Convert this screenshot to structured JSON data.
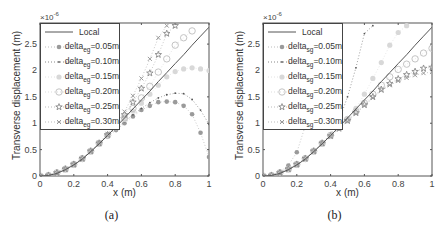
{
  "chart_data": [
    {
      "type": "line",
      "panel_label": "(a)",
      "title": "",
      "xlabel": "x (m)",
      "ylabel": "Transverse displacement (m)",
      "y_exponent": "×10^-6",
      "xlim": [
        0,
        1
      ],
      "ylim": [
        0,
        2.9
      ],
      "xticks": [
        "0",
        "0.2",
        "0.4",
        "0.6",
        "0.8",
        "1"
      ],
      "yticks": [
        "0",
        "0.5",
        "1",
        "1.5",
        "2",
        "2.5"
      ],
      "legend_position": "upper left",
      "subscript": "eg",
      "series": [
        {
          "name": "Local",
          "marker": "line",
          "x": [
            0,
            0.05,
            0.1,
            0.15,
            0.2,
            0.25,
            0.3,
            0.35,
            0.4,
            0.45,
            0.5,
            0.55,
            0.6,
            0.65,
            0.7,
            0.75,
            0.8,
            0.85,
            0.9,
            0.95,
            1.0
          ],
          "y": [
            0,
            0.01,
            0.05,
            0.12,
            0.21,
            0.32,
            0.46,
            0.61,
            0.77,
            0.93,
            1.1,
            1.27,
            1.44,
            1.61,
            1.79,
            1.96,
            2.13,
            2.3,
            2.48,
            2.65,
            2.82
          ]
        },
        {
          "name": "delta_eg=0.05m",
          "marker": "filled-circle",
          "x": [
            0,
            0.05,
            0.1,
            0.15,
            0.2,
            0.25,
            0.3,
            0.35,
            0.4,
            0.45,
            0.5,
            0.55,
            0.6,
            0.65,
            0.7,
            0.75,
            0.8,
            0.85,
            0.9,
            0.95,
            1.0
          ],
          "y": [
            0,
            0.01,
            0.06,
            0.13,
            0.22,
            0.33,
            0.47,
            0.62,
            0.75,
            0.87,
            1.0,
            1.13,
            1.25,
            1.33,
            1.4,
            1.41,
            1.4,
            1.33,
            1.17,
            0.82,
            0.36
          ]
        },
        {
          "name": "delta_eg=0.10m",
          "marker": "dot",
          "x": [
            0,
            0.05,
            0.1,
            0.15,
            0.2,
            0.25,
            0.3,
            0.35,
            0.4,
            0.45,
            0.5,
            0.55,
            0.6,
            0.65,
            0.7,
            0.75,
            0.8,
            0.85,
            0.9,
            0.95,
            1.0
          ],
          "y": [
            0,
            0.01,
            0.06,
            0.13,
            0.22,
            0.33,
            0.47,
            0.62,
            0.77,
            0.9,
            1.03,
            1.16,
            1.28,
            1.39,
            1.48,
            1.54,
            1.57,
            1.56,
            1.45,
            1.25,
            0.98
          ]
        },
        {
          "name": "delta_eg=0.15m",
          "marker": "filled-circle-light",
          "x": [
            0,
            0.05,
            0.1,
            0.15,
            0.2,
            0.25,
            0.3,
            0.35,
            0.4,
            0.45,
            0.5,
            0.55,
            0.6,
            0.65,
            0.7,
            0.75,
            0.8,
            0.85,
            0.9,
            0.95,
            1.0
          ],
          "y": [
            0,
            0.01,
            0.06,
            0.13,
            0.22,
            0.33,
            0.47,
            0.62,
            0.77,
            0.92,
            1.07,
            1.23,
            1.38,
            1.55,
            1.72,
            1.88,
            1.98,
            2.03,
            2.05,
            2.03,
            2.0
          ]
        },
        {
          "name": "delta_eg=0.20m",
          "marker": "open-circle",
          "x": [
            0,
            0.05,
            0.1,
            0.15,
            0.2,
            0.25,
            0.3,
            0.35,
            0.4,
            0.45,
            0.5,
            0.55,
            0.6,
            0.65,
            0.7,
            0.75,
            0.8,
            0.85,
            0.9
          ],
          "y": [
            0,
            0.01,
            0.06,
            0.13,
            0.22,
            0.33,
            0.47,
            0.62,
            0.77,
            0.93,
            1.1,
            1.28,
            1.48,
            1.7,
            1.97,
            2.22,
            2.48,
            2.62,
            2.75
          ]
        },
        {
          "name": "delta_eg=0.25m",
          "marker": "star",
          "x": [
            0,
            0.05,
            0.1,
            0.15,
            0.2,
            0.25,
            0.3,
            0.35,
            0.4,
            0.45,
            0.5,
            0.55,
            0.6,
            0.65,
            0.7,
            0.75,
            0.8
          ],
          "y": [
            0,
            0.01,
            0.06,
            0.13,
            0.22,
            0.33,
            0.47,
            0.62,
            0.78,
            0.96,
            1.16,
            1.4,
            1.66,
            1.95,
            2.3,
            2.7,
            2.85
          ]
        },
        {
          "name": "delta_eg=0.30m",
          "marker": "x",
          "x": [
            0,
            0.05,
            0.1,
            0.15,
            0.2,
            0.25,
            0.3,
            0.35,
            0.4,
            0.45,
            0.5,
            0.55,
            0.6,
            0.65,
            0.7,
            0.75
          ],
          "y": [
            0,
            0.01,
            0.06,
            0.13,
            0.22,
            0.33,
            0.47,
            0.63,
            0.8,
            0.99,
            1.22,
            1.52,
            1.85,
            2.22,
            2.62,
            2.85
          ]
        }
      ]
    },
    {
      "type": "line",
      "panel_label": "(b)",
      "title": "",
      "xlabel": "x (m)",
      "ylabel": "Transverse displacement (m)",
      "y_exponent": "×10^-6",
      "xlim": [
        0,
        1
      ],
      "ylim": [
        0,
        2.9
      ],
      "xticks": [
        "0",
        "0.2",
        "0.4",
        "0.6",
        "0.8",
        "1"
      ],
      "yticks": [
        "0",
        "0.5",
        "1",
        "1.5",
        "2",
        "2.5"
      ],
      "legend_position": "upper left",
      "subscript": "sg",
      "series": [
        {
          "name": "Local",
          "marker": "line",
          "x": [
            0,
            0.05,
            0.1,
            0.15,
            0.2,
            0.25,
            0.3,
            0.35,
            0.4,
            0.45,
            0.5,
            0.55,
            0.6,
            0.65,
            0.7,
            0.75,
            0.8,
            0.85,
            0.9,
            0.95,
            1.0
          ],
          "y": [
            0,
            0.01,
            0.05,
            0.12,
            0.21,
            0.32,
            0.46,
            0.61,
            0.77,
            0.93,
            1.1,
            1.27,
            1.44,
            1.61,
            1.79,
            1.96,
            2.13,
            2.3,
            2.48,
            2.65,
            2.82
          ]
        },
        {
          "name": "delta_sg=0.05m",
          "marker": "filled-circle",
          "x": [
            0,
            0.05,
            0.1,
            0.15,
            0.2,
            0.25,
            0.3
          ],
          "y": [
            0,
            0.02,
            0.08,
            0.2,
            0.45,
            0.95,
            1.6
          ]
        },
        {
          "name": "delta_sg=0.10m",
          "marker": "dot",
          "x": [
            0,
            0.05,
            0.1,
            0.15,
            0.2,
            0.25,
            0.3,
            0.35,
            0.4,
            0.45,
            0.5,
            0.55,
            0.6,
            0.65
          ],
          "y": [
            0,
            0.01,
            0.06,
            0.13,
            0.22,
            0.33,
            0.47,
            0.62,
            0.8,
            1.05,
            1.5,
            2.05,
            2.7,
            2.85
          ]
        },
        {
          "name": "delta_sg=0.15m",
          "marker": "filled-circle-light",
          "x": [
            0,
            0.05,
            0.1,
            0.15,
            0.2,
            0.25,
            0.3,
            0.35,
            0.4,
            0.45,
            0.5,
            0.55,
            0.6,
            0.65,
            0.7,
            0.75,
            0.8,
            0.85
          ],
          "y": [
            0,
            0.01,
            0.06,
            0.13,
            0.22,
            0.33,
            0.47,
            0.62,
            0.77,
            0.92,
            1.08,
            1.28,
            1.55,
            1.85,
            2.15,
            2.48,
            2.72,
            2.85
          ]
        },
        {
          "name": "delta_sg=0.20m",
          "marker": "open-circle",
          "x": [
            0,
            0.05,
            0.1,
            0.15,
            0.2,
            0.25,
            0.3,
            0.35,
            0.4,
            0.45,
            0.5,
            0.55,
            0.6,
            0.65,
            0.7,
            0.75,
            0.8,
            0.85,
            0.9,
            0.95,
            1.0
          ],
          "y": [
            0,
            0.01,
            0.06,
            0.13,
            0.22,
            0.33,
            0.47,
            0.62,
            0.77,
            0.92,
            1.07,
            1.22,
            1.38,
            1.55,
            1.72,
            1.88,
            2.02,
            2.12,
            2.22,
            2.33,
            2.42
          ]
        },
        {
          "name": "delta_sg=0.25m",
          "marker": "star",
          "x": [
            0,
            0.05,
            0.1,
            0.15,
            0.2,
            0.25,
            0.3,
            0.35,
            0.4,
            0.45,
            0.5,
            0.55,
            0.6,
            0.65,
            0.7,
            0.75,
            0.8,
            0.85,
            0.9,
            0.95,
            1.0
          ],
          "y": [
            0,
            0.01,
            0.06,
            0.13,
            0.22,
            0.33,
            0.47,
            0.62,
            0.76,
            0.9,
            1.05,
            1.2,
            1.35,
            1.5,
            1.64,
            1.75,
            1.84,
            1.92,
            1.98,
            2.04,
            2.06
          ]
        },
        {
          "name": "delta_sg=0.30m",
          "marker": "x",
          "x": [
            0,
            0.05,
            0.1,
            0.15,
            0.2,
            0.25,
            0.3,
            0.35,
            0.4,
            0.45,
            0.5,
            0.55,
            0.6,
            0.65,
            0.7,
            0.75,
            0.8,
            0.85,
            0.9,
            0.95,
            1.0
          ],
          "y": [
            0,
            0.01,
            0.06,
            0.13,
            0.22,
            0.33,
            0.47,
            0.62,
            0.75,
            0.89,
            1.03,
            1.18,
            1.33,
            1.48,
            1.62,
            1.72,
            1.8,
            1.86,
            1.91,
            1.95,
            1.97
          ]
        }
      ]
    }
  ],
  "panels": [
    {
      "caption": "(a)",
      "xlabel": "x (m)",
      "ylabel": "Transverse displacement (m)",
      "exponent_base": "×10",
      "exponent_power": "-6",
      "legend": [
        {
          "prefix": "Local",
          "sub": "",
          "suffix": ""
        },
        {
          "prefix": "delta",
          "sub": "eg",
          "suffix": "=0.05m"
        },
        {
          "prefix": "delta",
          "sub": "eg",
          "suffix": "=0.10m"
        },
        {
          "prefix": "delta",
          "sub": "eg",
          "suffix": "=0.15m"
        },
        {
          "prefix": "delta",
          "sub": "eg",
          "suffix": "=0.20m"
        },
        {
          "prefix": "delta",
          "sub": "eg",
          "suffix": "=0.25m"
        },
        {
          "prefix": "delta",
          "sub": "eg",
          "suffix": "=0.30m"
        }
      ]
    },
    {
      "caption": "(b)",
      "xlabel": "x (m)",
      "ylabel": "Transverse displacement (m)",
      "exponent_base": "×10",
      "exponent_power": "-6",
      "legend": [
        {
          "prefix": "Local",
          "sub": "",
          "suffix": ""
        },
        {
          "prefix": "delta",
          "sub": "sg",
          "suffix": "=0.05m"
        },
        {
          "prefix": "delta",
          "sub": "sg",
          "suffix": "=0.10m"
        },
        {
          "prefix": "delta",
          "sub": "sg",
          "suffix": "=0.15m"
        },
        {
          "prefix": "delta",
          "sub": "sg",
          "suffix": "=0.20m"
        },
        {
          "prefix": "delta",
          "sub": "sg",
          "suffix": "=0.25m"
        },
        {
          "prefix": "delta",
          "sub": "sg",
          "suffix": "=0.30m"
        }
      ]
    }
  ],
  "colors": {
    "axis": "#555555",
    "local_line": "#555555",
    "series_0.05": "#9a9a9a",
    "series_0.10": "#666666",
    "series_0.15": "#d6d6d6",
    "series_0.20": "#c4c4c4",
    "series_0.25": "#8a8a8a",
    "series_0.30": "#9a9a9a"
  }
}
